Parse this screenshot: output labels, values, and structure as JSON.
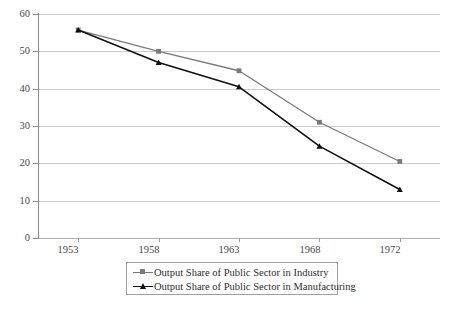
{
  "chart_data": {
    "type": "line",
    "title": "",
    "subtitle": "",
    "xlabel": "",
    "ylabel": "",
    "categories": [
      "1953",
      "1958",
      "1963",
      "1968",
      "1972"
    ],
    "x": [
      1953,
      1958,
      1963,
      1968,
      1972
    ],
    "ylim": [
      0,
      60
    ],
    "yticks": [
      "0",
      "10",
      "20",
      "30",
      "40",
      "50",
      "60"
    ],
    "ytick_values": [
      0,
      10,
      20,
      30,
      40,
      50,
      60
    ],
    "grid": "horizontal",
    "legend_position": "bottom",
    "series": [
      {
        "name": "Output Share of Public Sector in Industry",
        "values": [
          55.7,
          50.0,
          44.8,
          31.0,
          20.5
        ],
        "color": "#7a7a7a",
        "marker": "square"
      },
      {
        "name": "Output Share of Public Sector in Manufacturing",
        "values": [
          55.7,
          47.0,
          40.5,
          24.6,
          13.0
        ],
        "color": "#101010",
        "marker": "triangle"
      }
    ]
  },
  "legend": {
    "entries": [
      {
        "label": "Output Share of Public Sector in Industry",
        "marker": "square-marker",
        "color": "#7a7a7a"
      },
      {
        "label": "Output Share of Public Sector in Manufacturing",
        "marker": "triangle-marker",
        "color": "#101010"
      }
    ]
  },
  "axes": {
    "y_tick_labels": [
      "60",
      "50",
      "40",
      "30",
      "20",
      "10",
      "0"
    ],
    "x_tick_labels": [
      "1953",
      "1958",
      "1963",
      "1968",
      "1972"
    ]
  },
  "colors": {
    "series_industry": "#7a7a7a",
    "series_manufacturing": "#101010",
    "gridline": "#c9c9c9",
    "axis": "#8a8a8a",
    "text": "#4a4a4a",
    "legend_border": "#9f9f9f",
    "background": "#ffffff"
  }
}
